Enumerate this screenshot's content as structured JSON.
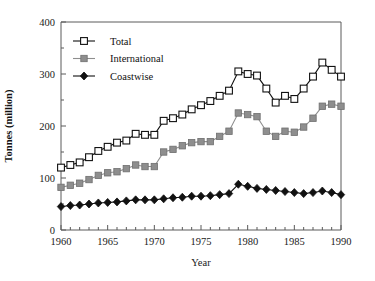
{
  "chart_data": {
    "type": "line",
    "title": "",
    "title_note": "title row is cropped off the top edge of the screenshot and is not legible",
    "xlabel": "Year",
    "ylabel": "Tonnes (million)",
    "xlim": [
      1960,
      1990
    ],
    "ylim": [
      0,
      400
    ],
    "xticks": [
      1960,
      1965,
      1970,
      1975,
      1980,
      1985,
      1990
    ],
    "yticks": [
      0,
      100,
      200,
      300,
      400
    ],
    "minor_y_step": 50,
    "minor_x_step": 1,
    "grid": false,
    "legend_position": "top-left inside plot",
    "x": [
      1960,
      1961,
      1962,
      1963,
      1964,
      1965,
      1966,
      1967,
      1968,
      1969,
      1970,
      1971,
      1972,
      1973,
      1974,
      1975,
      1976,
      1977,
      1978,
      1979,
      1980,
      1981,
      1982,
      1983,
      1984,
      1985,
      1986,
      1987,
      1988,
      1989,
      1990
    ],
    "series": [
      {
        "name": "Total",
        "marker": "open-square",
        "color": "#111111",
        "values": [
          120,
          125,
          130,
          140,
          152,
          160,
          168,
          172,
          185,
          183,
          183,
          210,
          215,
          222,
          232,
          240,
          248,
          258,
          268,
          305,
          300,
          297,
          272,
          245,
          258,
          252,
          272,
          295,
          322,
          308,
          295
        ]
      },
      {
        "name": "International",
        "marker": "filled-square",
        "color": "#8e8e8e",
        "values": [
          82,
          86,
          90,
          97,
          105,
          110,
          112,
          118,
          125,
          122,
          122,
          150,
          155,
          162,
          168,
          170,
          170,
          180,
          190,
          225,
          222,
          218,
          190,
          180,
          190,
          188,
          198,
          215,
          238,
          242,
          238
        ]
      },
      {
        "name": "Coastwise",
        "marker": "filled-diamond",
        "color": "#111111",
        "values": [
          45,
          47,
          48,
          50,
          52,
          53,
          54,
          56,
          58,
          58,
          58,
          60,
          62,
          63,
          65,
          65,
          66,
          68,
          70,
          88,
          84,
          80,
          78,
          76,
          74,
          72,
          70,
          72,
          75,
          72,
          68
        ]
      }
    ]
  },
  "legend": {
    "items": [
      {
        "label": "Total",
        "marker": "open-square"
      },
      {
        "label": "International",
        "marker": "filled-square"
      },
      {
        "label": "Coastwise",
        "marker": "filled-diamond"
      }
    ]
  },
  "axes": {
    "y_title": "Tonnes (million)",
    "x_title": "Year",
    "y_tick_labels": [
      "0",
      "100",
      "200",
      "300",
      "400"
    ],
    "x_tick_labels": [
      "1960",
      "1965",
      "1970",
      "1975",
      "1980",
      "1985",
      "1990"
    ]
  }
}
